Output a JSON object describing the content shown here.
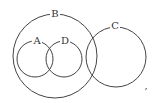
{
  "diagram": {
    "type": "venn",
    "stroke_color": "#444444",
    "sets": [
      {
        "label": "B",
        "cx": 55,
        "cy": 56,
        "r": 42,
        "label_x": 55,
        "label_y": 17
      },
      {
        "label": "A",
        "cx": 35,
        "cy": 59,
        "r": 18,
        "label_x": 37,
        "label_y": 44
      },
      {
        "label": "D",
        "cx": 64,
        "cy": 59,
        "r": 18,
        "label_x": 65,
        "label_y": 44
      },
      {
        "label": "C",
        "cx": 116,
        "cy": 57,
        "r": 30,
        "label_x": 115,
        "label_y": 29
      }
    ],
    "trailing_mark": ","
  }
}
